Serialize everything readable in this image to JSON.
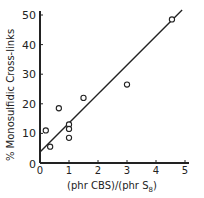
{
  "chart_data": {
    "type": "scatter",
    "title": "",
    "xlabel": "(phr CBS)/(phr S8)",
    "xlabel_parts": {
      "main": "(phr CBS)/(phr S",
      "sub": "8",
      "end": ")"
    },
    "ylabel": "% Monosulfidic Cross-links",
    "xlim": [
      0,
      5
    ],
    "ylim": [
      0,
      50
    ],
    "x_ticks": [
      0,
      1,
      2,
      3,
      4,
      5
    ],
    "y_ticks": [
      0,
      10,
      20,
      30,
      40,
      50
    ],
    "grid": false,
    "legend": null,
    "series": [
      {
        "name": "data",
        "marker": "open-circle",
        "points": [
          {
            "x": 0.2,
            "y": 11
          },
          {
            "x": 0.35,
            "y": 5.5
          },
          {
            "x": 0.65,
            "y": 18.5
          },
          {
            "x": 1.0,
            "y": 13
          },
          {
            "x": 1.0,
            "y": 11.5
          },
          {
            "x": 1.0,
            "y": 8.5
          },
          {
            "x": 1.5,
            "y": 22
          },
          {
            "x": 3.0,
            "y": 26.5
          },
          {
            "x": 4.55,
            "y": 48.5
          }
        ]
      }
    ],
    "fit_line": {
      "type": "linear",
      "intercept": 3.7,
      "slope": 9.8,
      "x_start": 0,
      "x_end": 4.9
    }
  },
  "colors": {
    "ink": "#222222",
    "background": "#ffffff"
  }
}
